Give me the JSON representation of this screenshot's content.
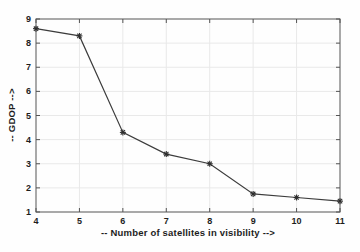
{
  "chart_data": {
    "type": "line",
    "title": "",
    "xlabel": "-- Number of satellites in visibility -->",
    "ylabel": "-- GDOP -->",
    "x": [
      4,
      5,
      6,
      7,
      8,
      9,
      10,
      11
    ],
    "series": [
      {
        "name": "GDOP",
        "values": [
          8.6,
          8.3,
          4.3,
          3.4,
          3.0,
          1.75,
          1.6,
          1.45
        ]
      }
    ],
    "xlim": [
      4,
      11
    ],
    "ylim": [
      1,
      9
    ],
    "x_ticks": [
      4,
      5,
      6,
      7,
      8,
      9,
      10,
      11
    ],
    "y_ticks": [
      1,
      2,
      3,
      4,
      5,
      6,
      7,
      8,
      9
    ],
    "grid": true,
    "legend_position": "none",
    "marker": "asterisk",
    "colors": {
      "line": "#3c3c3c",
      "marker": "#2e2e2e",
      "grid": "#e9e9e9",
      "axis": "#555555",
      "tick_text": "#1d1d1d",
      "plot_background": "#fefefe"
    }
  }
}
